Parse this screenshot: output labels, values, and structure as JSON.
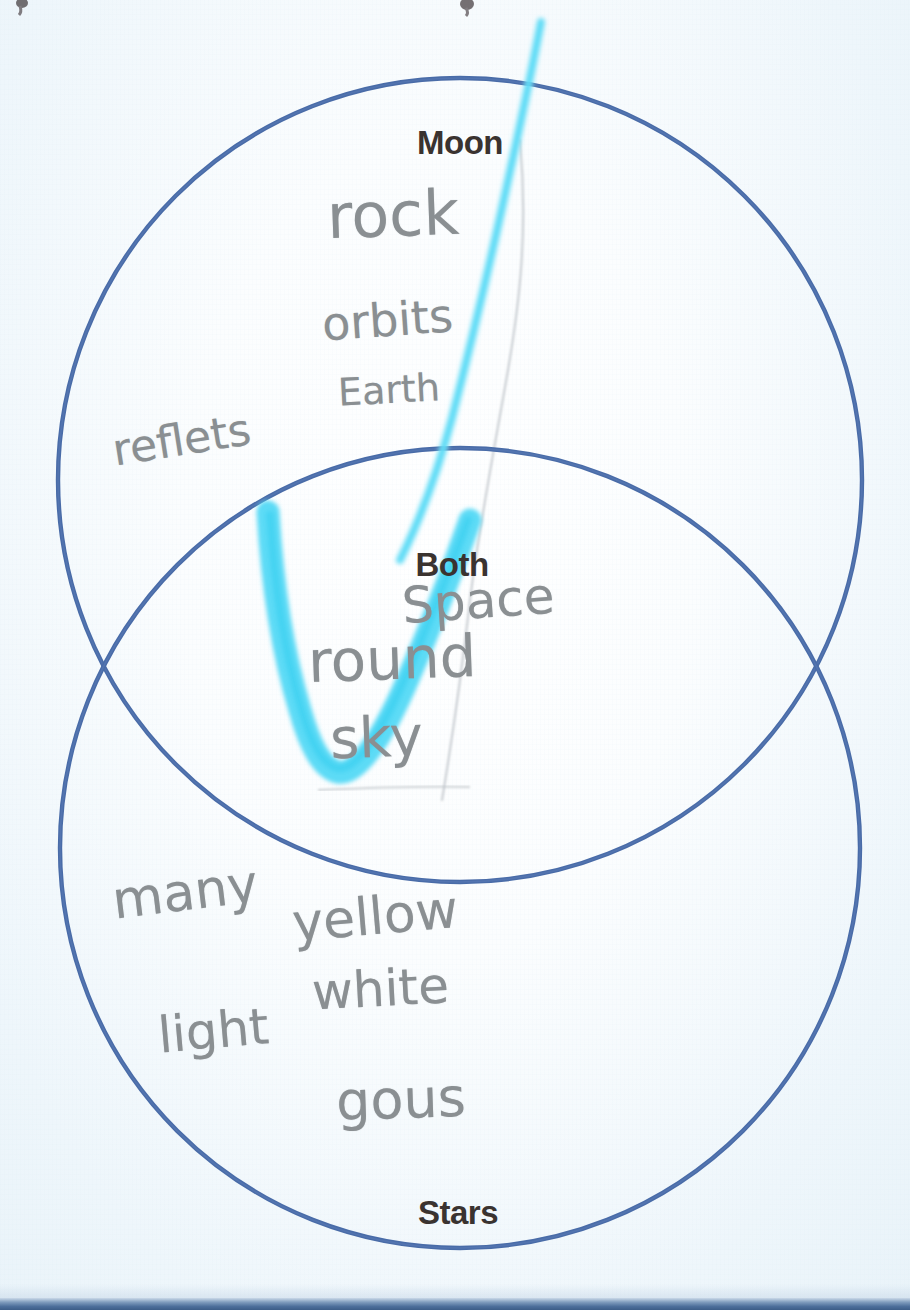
{
  "document": {
    "kind": "scanned-worksheet",
    "subject": "Venn diagram comparing Moon and Stars",
    "background_color": "#f2f8fb",
    "scan_edge_color": "#3c5d87"
  },
  "venn": {
    "circle_stroke_color": "#4a6ca8",
    "circles": [
      {
        "id": "moon",
        "label": "Moon",
        "cx": 460,
        "cy": 480,
        "r": 402
      },
      {
        "id": "stars",
        "label": "Stars",
        "cx": 460,
        "cy": 848,
        "r": 400
      }
    ],
    "labels": [
      {
        "id": "moon-label",
        "text": "Moon",
        "x": 460,
        "y": 124
      },
      {
        "id": "both-label",
        "text": "Both",
        "x": 452,
        "y": 546
      },
      {
        "id": "stars-label",
        "text": "Stars",
        "x": 458,
        "y": 1194
      }
    ]
  },
  "annotations": {
    "marker_color": "#4fd8f5",
    "pencil_color": "#8a8f92",
    "moon_only": [
      {
        "text": "rock",
        "x": 327,
        "y": 178,
        "size": 62,
        "rot": -2,
        "weight": 400
      },
      {
        "text": "orbits",
        "x": 322,
        "y": 293,
        "size": 46,
        "rot": -4,
        "weight": 400
      },
      {
        "text": "Earth",
        "x": 338,
        "y": 368,
        "size": 38,
        "rot": -3,
        "weight": 400
      },
      {
        "text": "reflets",
        "x": 112,
        "y": 414,
        "size": 44,
        "rot": -9,
        "weight": 400
      }
    ],
    "both": [
      {
        "text": "Space",
        "x": 402,
        "y": 572,
        "size": 50,
        "rot": -4,
        "weight": 400
      },
      {
        "text": "round",
        "x": 308,
        "y": 625,
        "size": 58,
        "rot": -2,
        "weight": 400
      },
      {
        "text": "sky",
        "x": 330,
        "y": 705,
        "size": 56,
        "rot": -2,
        "weight": 400
      }
    ],
    "stars_only": [
      {
        "text": "many",
        "x": 112,
        "y": 862,
        "size": 52,
        "rot": -7,
        "weight": 400
      },
      {
        "text": "yellow",
        "x": 292,
        "y": 886,
        "size": 52,
        "rot": -5,
        "weight": 400
      },
      {
        "text": "white",
        "x": 312,
        "y": 960,
        "size": 50,
        "rot": -3,
        "weight": 400
      },
      {
        "text": "light",
        "x": 158,
        "y": 1002,
        "size": 50,
        "rot": -5,
        "weight": 400
      },
      {
        "text": "gous",
        "x": 336,
        "y": 1068,
        "size": 54,
        "rot": -2,
        "weight": 400
      }
    ]
  }
}
